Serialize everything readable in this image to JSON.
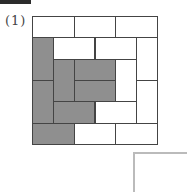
{
  "header": {
    "tab_color": "#2b2b2b"
  },
  "problem": {
    "label": "(1)"
  },
  "grid": {
    "units": 6,
    "colors": {
      "shaded": "#8f8f8f",
      "blank": "#ffffff",
      "border": "#444444"
    },
    "rects": [
      {
        "c": 0,
        "r": 0,
        "w": 2,
        "h": 1,
        "shaded": false
      },
      {
        "c": 2,
        "r": 0,
        "w": 2,
        "h": 1,
        "shaded": false
      },
      {
        "c": 4,
        "r": 0,
        "w": 2,
        "h": 1,
        "shaded": false
      },
      {
        "c": 0,
        "r": 1,
        "w": 1,
        "h": 2,
        "shaded": true
      },
      {
        "c": 1,
        "r": 1,
        "w": 2,
        "h": 1,
        "shaded": false
      },
      {
        "c": 3,
        "r": 1,
        "w": 2,
        "h": 1,
        "shaded": false
      },
      {
        "c": 5,
        "r": 1,
        "w": 1,
        "h": 2,
        "shaded": false
      },
      {
        "c": 1,
        "r": 2,
        "w": 1,
        "h": 2,
        "shaded": true
      },
      {
        "c": 2,
        "r": 2,
        "w": 2,
        "h": 1,
        "shaded": true
      },
      {
        "c": 4,
        "r": 2,
        "w": 1,
        "h": 2,
        "shaded": false
      },
      {
        "c": 0,
        "r": 3,
        "w": 1,
        "h": 2,
        "shaded": true
      },
      {
        "c": 2,
        "r": 3,
        "w": 2,
        "h": 1,
        "shaded": true
      },
      {
        "c": 5,
        "r": 3,
        "w": 1,
        "h": 2,
        "shaded": false
      },
      {
        "c": 1,
        "r": 4,
        "w": 2,
        "h": 1,
        "shaded": true
      },
      {
        "c": 3,
        "r": 4,
        "w": 2,
        "h": 1,
        "shaded": false
      },
      {
        "c": 0,
        "r": 5,
        "w": 2,
        "h": 1,
        "shaded": true
      },
      {
        "c": 2,
        "r": 5,
        "w": 2,
        "h": 1,
        "shaded": false
      },
      {
        "c": 4,
        "r": 5,
        "w": 2,
        "h": 1,
        "shaded": false
      }
    ]
  }
}
